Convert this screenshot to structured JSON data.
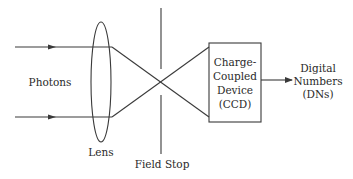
{
  "diagram": {
    "type": "optical-imaging-flow",
    "colors": {
      "line": "#3a3a3a",
      "text": "#2a2a2a",
      "background": "#ffffff"
    },
    "labels": {
      "photons": "Photons",
      "lens": "Lens",
      "field_stop": "Field Stop",
      "ccd_lines": [
        "Charge-",
        "Coupled",
        "Device",
        "(CCD)"
      ],
      "output_lines": [
        "Digital",
        "Numbers",
        "(DNs)"
      ]
    },
    "nodes": [
      {
        "id": "photons",
        "label": "Photons"
      },
      {
        "id": "lens",
        "label": "Lens",
        "shape": "ellipse"
      },
      {
        "id": "field_stop",
        "label": "Field Stop",
        "shape": "vertical-line-with-aperture"
      },
      {
        "id": "ccd",
        "label": "Charge-Coupled Device (CCD)",
        "shape": "rectangle"
      },
      {
        "id": "dns",
        "label": "Digital Numbers (DNs)"
      }
    ],
    "edges": [
      {
        "from": "photons",
        "to": "lens",
        "label": "",
        "note": "two parallel rays"
      },
      {
        "from": "lens",
        "to": "field_stop",
        "label": "",
        "note": "rays converge and cross at aperture"
      },
      {
        "from": "field_stop",
        "to": "ccd",
        "label": ""
      },
      {
        "from": "ccd",
        "to": "dns",
        "label": "",
        "note": "arrow"
      }
    ]
  }
}
